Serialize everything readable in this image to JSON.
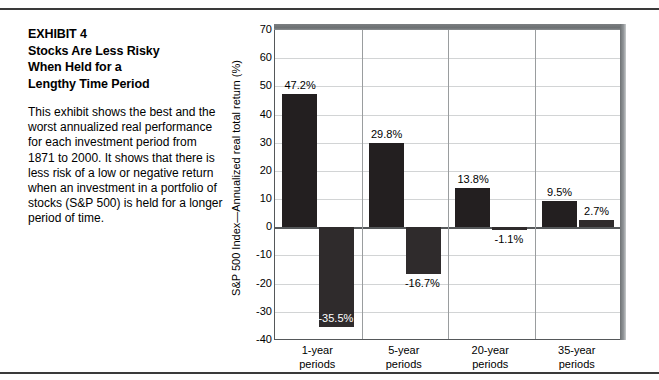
{
  "exhibit": {
    "title_lines": [
      "EXHIBIT 4",
      "Stocks Are Less Risky",
      "When Held for a",
      "Lengthy Time Period"
    ],
    "body": "This exhibit shows the best and the worst annualized real performance for each investment period from 1871 to 2000. It shows that there is less risk of a low or negative return when an investment in a portfolio of stocks (S&P 500) is held for a longer period of time."
  },
  "colors": {
    "bar": "#231f20",
    "axis": "#55585a",
    "grid": "#d2d4d5",
    "frame_shade": "#6e7274",
    "text": "#000000",
    "inside_label": "#ffffff"
  },
  "chart_data": {
    "type": "bar",
    "title": "",
    "xlabel": "",
    "ylabel": "S&P 500 Index—Annualized real total return (%)",
    "categories": [
      "1-year periods",
      "5-year periods",
      "20-year periods",
      "35-year periods"
    ],
    "category_lines": [
      [
        "1-year",
        "periods"
      ],
      [
        "5-year",
        "periods"
      ],
      [
        "20-year",
        "periods"
      ],
      [
        "35-year",
        "periods"
      ]
    ],
    "series": [
      {
        "name": "Best annualized real return",
        "values": [
          47.2,
          29.8,
          13.8,
          9.5
        ]
      },
      {
        "name": "Worst annualized real return",
        "values": [
          -35.5,
          -16.7,
          -1.1,
          2.7
        ]
      }
    ],
    "data_labels": [
      [
        "47.2%",
        "29.8%",
        "13.8%",
        "9.5%"
      ],
      [
        "-35.5%",
        "-16.7%",
        "-1.1%",
        "2.7%"
      ]
    ],
    "ylim": [
      -40,
      70
    ],
    "yticks": [
      70,
      60,
      50,
      40,
      30,
      20,
      10,
      0,
      -10,
      -20,
      -30,
      -40
    ],
    "ytick_labels": [
      "70",
      "60",
      "50",
      "40",
      "30",
      "20",
      "10",
      "0",
      "-10",
      "-20",
      "-30",
      "-40"
    ],
    "grid": true,
    "legend": "none"
  }
}
